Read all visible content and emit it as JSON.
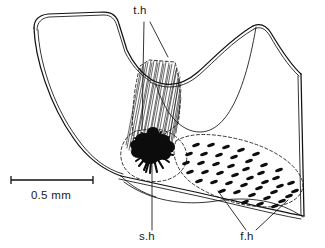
{
  "figure": {
    "domain": "scientific-line-drawing",
    "background_color": "#ffffff",
    "ink_color": "#111111",
    "width": 325,
    "height": 248
  },
  "labels": [
    {
      "id": "th",
      "text": "t.h",
      "meaning": "tactile hairs",
      "x": 140,
      "y": 14,
      "leader_count": 2
    },
    {
      "id": "sh",
      "text": "s.h",
      "meaning": "sensory hair tuft",
      "x": 147,
      "y": 240,
      "leader_count": 1
    },
    {
      "id": "fh",
      "text": "f.h",
      "meaning": "feathered hairs",
      "x": 247,
      "y": 240,
      "leader_count": 2
    }
  ],
  "scale_bar": {
    "caption": "0.5 mm",
    "value": 0.5,
    "unit": "mm",
    "bar_x_start": 11,
    "bar_x_end": 93,
    "bar_y": 180,
    "caption_x": 51,
    "caption_y": 199
  },
  "regions": {
    "tactile_hair_band": {
      "label_ref": "th",
      "style": "fine parallel striations",
      "hair_count": 26
    },
    "sensory_hair_tuft": {
      "label_ref": "sh",
      "style": "dense black blob with radiating spines",
      "spine_count": 17
    },
    "feathered_hair_field": {
      "label_ref": "fh",
      "style": "dashed outline enclosing rows of short dark dashes",
      "dash_rows": 7
    }
  },
  "colors": {
    "ink": "#111111",
    "blob": "#0c0c0c",
    "paper": "#ffffff"
  }
}
